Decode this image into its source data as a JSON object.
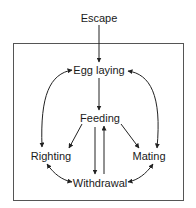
{
  "diagram": {
    "type": "behavioral-hierarchy",
    "nodes": {
      "escape": {
        "label": "Escape",
        "x": 99,
        "y": 18
      },
      "egg_laying": {
        "label": "Egg laying",
        "x": 99,
        "y": 70
      },
      "feeding": {
        "label": "Feeding",
        "x": 100,
        "y": 118
      },
      "righting": {
        "label": "Righting",
        "x": 51,
        "y": 156
      },
      "mating": {
        "label": "Mating",
        "x": 149,
        "y": 156
      },
      "withdrawal": {
        "label": "Withdrawal",
        "x": 100,
        "y": 183
      }
    },
    "edges": [
      {
        "from": "Escape",
        "to": "Egg laying",
        "direction": "one-way"
      },
      {
        "from": "Egg laying",
        "to": "Feeding",
        "direction": "one-way"
      },
      {
        "from": "Egg laying",
        "to": "Righting",
        "direction": "two-way"
      },
      {
        "from": "Egg laying",
        "to": "Mating",
        "direction": "two-way"
      },
      {
        "from": "Feeding",
        "to": "Righting",
        "direction": "one-way"
      },
      {
        "from": "Feeding",
        "to": "Mating",
        "direction": "one-way"
      },
      {
        "from": "Feeding",
        "to": "Withdrawal",
        "direction": "one-way"
      },
      {
        "from": "Withdrawal",
        "to": "Feeding",
        "direction": "one-way"
      },
      {
        "from": "Righting",
        "to": "Withdrawal",
        "direction": "two-way"
      },
      {
        "from": "Mating",
        "to": "Withdrawal",
        "direction": "two-way"
      }
    ],
    "colors": {
      "line": "#222222",
      "box": "#555555",
      "text": "#1a1a1a",
      "background": "#ffffff"
    }
  }
}
